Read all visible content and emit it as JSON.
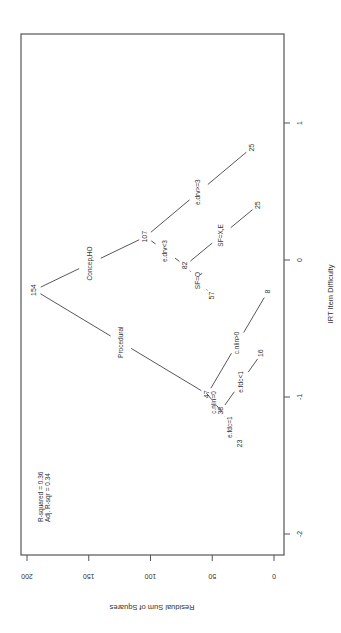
{
  "chart_data": {
    "type": "tree-scatter",
    "title": "",
    "orientation": "rotated 90° clockwise (page printed sideways)",
    "xlabel": "IRT Item Difficulty",
    "ylabel": "Residual Sum of Squares",
    "xlim": [
      -2.2,
      1.9
    ],
    "ylim": [
      0,
      205
    ],
    "x_ticks": [
      "-2",
      "-1",
      "0",
      "1"
    ],
    "y_ticks": [
      "0",
      "50",
      "100",
      "150",
      "200"
    ],
    "grid": false,
    "annotation": [
      "R-squared = 0.36",
      "Adj. R-sqr = 0.34"
    ],
    "nodes": [
      {
        "id": "n154",
        "label": "154",
        "x": -0.22,
        "rss": 194
      },
      {
        "id": "n107",
        "label": "107",
        "x": 0.17,
        "rss": 104
      },
      {
        "id": "n25a",
        "label": "25",
        "x": 0.82,
        "rss": 18
      },
      {
        "id": "n82",
        "label": "82",
        "x": -0.04,
        "rss": 72
      },
      {
        "id": "n25b",
        "label": "25",
        "x": 0.4,
        "rss": 13
      },
      {
        "id": "n57",
        "label": "57",
        "x": -0.26,
        "rss": 50
      },
      {
        "id": "n47",
        "label": "47",
        "x": -0.98,
        "rss": 54
      },
      {
        "id": "n8",
        "label": "8",
        "x": -0.23,
        "rss": 5
      },
      {
        "id": "n38",
        "label": "38",
        "x": -1.1,
        "rss": 43
      },
      {
        "id": "n16",
        "label": "16",
        "x": -0.68,
        "rss": 10
      },
      {
        "id": "n23",
        "label": "23",
        "x": -1.34,
        "rss": 27
      }
    ],
    "edges": [
      {
        "from": "n154",
        "to": "n107",
        "label": "Concep,HO"
      },
      {
        "from": "n154",
        "to": "n47",
        "label": "Procedural"
      },
      {
        "from": "n107",
        "to": "n25a",
        "label": "e.drv>=3"
      },
      {
        "from": "n107",
        "to": "n82",
        "label": "e.drv<3"
      },
      {
        "from": "n82",
        "to": "n25b",
        "label": "SF=X,E"
      },
      {
        "from": "n82",
        "to": "n57",
        "label": "SF=Q"
      },
      {
        "from": "n47",
        "to": "n8",
        "label": "c.nlin>0"
      },
      {
        "from": "n47",
        "to": "n38",
        "label": "c.nlin=0"
      },
      {
        "from": "n38",
        "to": "n16",
        "label": "e.fdc<1"
      },
      {
        "from": "n38",
        "to": "n23",
        "label": "e.fdc=1"
      }
    ]
  },
  "labels": {
    "r_squared": "R-squared = 0.36",
    "adj_r_squared": "Adj. R-sqr = 0.34",
    "x_axis_title": "IRT Item Difficulty",
    "y_axis_title": "Residual Sum of Squares"
  }
}
